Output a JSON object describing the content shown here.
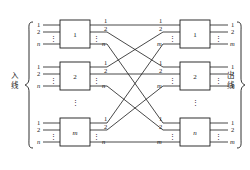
{
  "figure": {
    "type": "three-stage-switching-network-diagram",
    "left_side_label": "入线",
    "right_side_label": "出线",
    "ellipsis_glyph": "⋮",
    "line_color": "#1a1a1a",
    "background_color": "#ffffff"
  },
  "stage1": {
    "name": "left-column-blocks",
    "blocks": [
      {
        "label": "1",
        "inputs": [
          "1",
          "2",
          "⋮",
          "n"
        ],
        "outputs": [
          "1",
          "2",
          "⋮",
          "n"
        ]
      },
      {
        "label": "2",
        "inputs": [
          "1",
          "2",
          "⋮",
          "n"
        ],
        "outputs": [
          "1",
          "2",
          "⋮",
          "n"
        ]
      },
      {
        "label": "m",
        "inputs": [
          "1",
          "2",
          "⋮",
          "n"
        ],
        "outputs": [
          "1",
          "2",
          "⋮",
          "n"
        ]
      }
    ],
    "column_ellipsis": "⋮"
  },
  "stage2": {
    "name": "right-column-blocks",
    "blocks": [
      {
        "label": "1",
        "inputs": [
          "1",
          "2",
          "⋮",
          "m"
        ],
        "outputs": [
          "1",
          "2",
          "⋮",
          "m"
        ]
      },
      {
        "label": "2",
        "inputs": [
          "1",
          "2",
          "⋮",
          "m"
        ],
        "outputs": [
          "1",
          "2",
          "⋮",
          "m"
        ]
      },
      {
        "label": "n",
        "inputs": [
          "1",
          "2",
          "⋮",
          "m"
        ],
        "outputs": [
          "1",
          "2",
          "⋮",
          "m"
        ]
      }
    ],
    "column_ellipsis": "⋮"
  },
  "labels": {
    "one": "1",
    "two": "2",
    "n": "n",
    "m": "m",
    "dots": "⋮"
  }
}
